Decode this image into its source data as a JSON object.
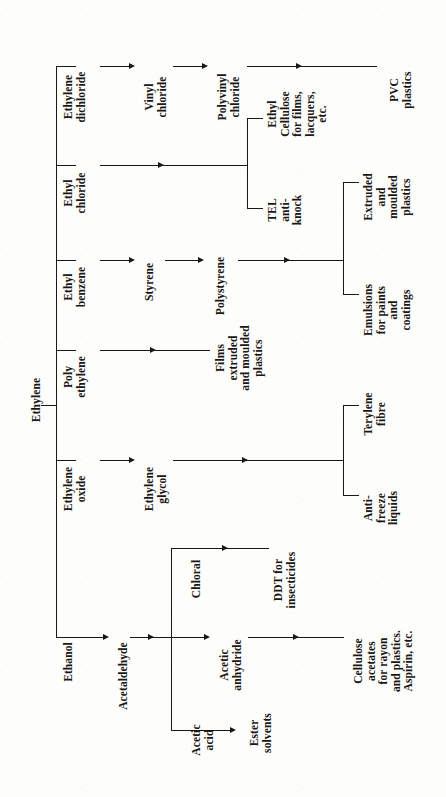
{
  "diagram": {
    "orientation": "rotated-90-ccw",
    "root": "Ethylene",
    "ink_color": "#1a1715",
    "paper_color": "#fdfdfb"
  },
  "nodes": {
    "root": "Ethylene",
    "branch1_a": "Ethylene\ndichloride",
    "branch1_b": "Vinyl\nchloride",
    "branch1_c": "Polyvinyl\nchloride",
    "branch1_d": "PVC\nplastics",
    "branch2_a": "Ethyl\nchloride",
    "branch2_up": "Ethyl\nCellulose\nfor films,\nlacquers,\netc.",
    "branch2_dn": "TEL\nanti-\nknock",
    "branch3_a": "Ethyl\nbenzene",
    "branch3_b": "Styrene",
    "branch3_c": "Polystyrene",
    "branch3_up": "Extruded\nand\nmoulded\nplastics",
    "branch3_dn": "Emulsions\nfor paints\nand\ncoatings",
    "branch4_a": "Poly\nethylene",
    "branch4_b": "Films\nextruded\nand moulded\nplastics",
    "branch5_a": "Ethylene\noxide",
    "branch5_b": "Ethylene\nglycol",
    "branch5_up": "Terylene\nfibre",
    "branch5_dn": "Anti-\nfreeze\nliquids",
    "branch6_a": "Ethanol",
    "branch6_b": "Acetaldehyde",
    "branch6_up": "Chloral",
    "branch6_up2": "DDT for\ninsecticides",
    "branch6_mid": "Acetic\nanhydride",
    "branch6_end": "Cellulose\nacetates\nfor rayon\nand plastics.\nAspirin, etc.",
    "branch6_dn": "Acetic\nacid",
    "branch6_dn2": "Ester\nsolvents"
  }
}
